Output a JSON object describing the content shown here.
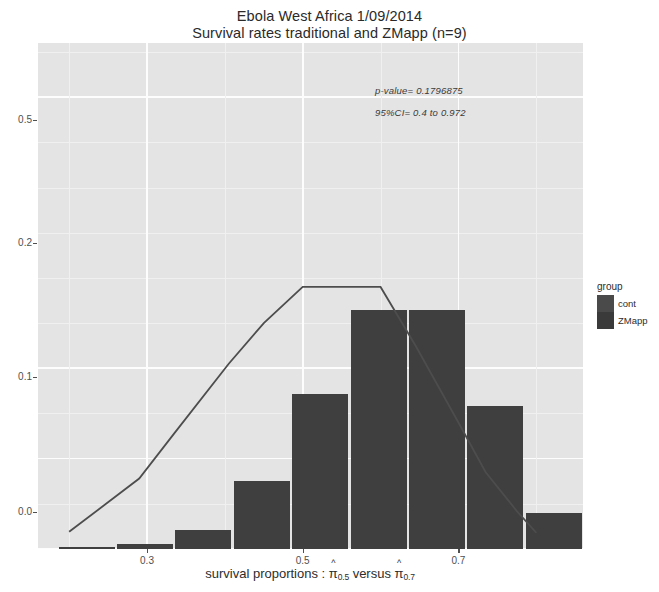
{
  "title": {
    "line1": "Ebola West Africa 1/09/2014",
    "line2": "Survival rates traditional and ZMapp (n=9)"
  },
  "annotations": {
    "p_value": "p-value=  0.1796875",
    "conf_int": "95%CI=  0.4 to 0.972"
  },
  "axis": {
    "x_title_prefix": "survival proportions : ",
    "x_title_var1": "π",
    "x_title_sub1": "0.5",
    "x_title_middle": " versus ",
    "x_title_var2": "π",
    "x_title_sub2": "0.7",
    "y_title": "Density"
  },
  "legend": {
    "title": "group",
    "items": [
      {
        "label": "cont",
        "color": "#4a4a4a"
      },
      {
        "label": "ZMapp",
        "color": "#3a3a3a"
      }
    ]
  },
  "colors": {
    "bar": "#3f3f3f",
    "line": "#4d4d4d",
    "panel": "#e4e4e4",
    "gridline": "#fdfdfd",
    "text": "#2d2d2d"
  },
  "chart_data": {
    "type": "bar",
    "xlabel": "survival proportions : pi-hat_0.5 versus pi-hat_0.7",
    "ylabel": "Density",
    "xlim": [
      0.16,
      0.86
    ],
    "ylim": [
      0.0,
      0.56
    ],
    "grid": true,
    "legend_position": "right",
    "x_ticks": [
      {
        "value": 0.3,
        "label": "0.3"
      },
      {
        "value": 0.5,
        "label": "0.5"
      },
      {
        "value": 0.7,
        "label": "0.7"
      }
    ],
    "y_ticks": [
      {
        "value": 0.5,
        "label": "0.5"
      },
      {
        "value": 0.2,
        "label": "0.2"
      },
      {
        "value": 0.1,
        "label": "0.1"
      },
      {
        "value": 0.0,
        "label": "0.0"
      }
    ],
    "bar_edges": [
      0.185,
      0.26,
      0.335,
      0.41,
      0.485,
      0.56,
      0.635,
      0.71,
      0.785,
      0.86
    ],
    "categories": [
      "0.185-0.26",
      "0.26-0.335",
      "0.335-0.41",
      "0.41-0.485",
      "0.485-0.56",
      "0.56-0.635",
      "0.635-0.71",
      "0.71-0.785",
      "0.785-0.86"
    ],
    "values": [
      0.002,
      0.006,
      0.021,
      0.075,
      0.172,
      0.265,
      0.265,
      0.158,
      0.04
    ],
    "series": [
      {
        "name": "Density histogram",
        "type": "bar",
        "values": [
          0.002,
          0.006,
          0.021,
          0.075,
          0.172,
          0.265,
          0.265,
          0.158,
          0.04
        ]
      },
      {
        "name": "Overlay curve",
        "type": "line",
        "x": [
          0.2,
          0.255,
          0.29,
          0.335,
          0.405,
          0.45,
          0.5,
          0.555,
          0.6,
          0.645,
          0.7,
          0.735,
          0.775,
          0.8
        ],
        "y": [
          0.019,
          0.055,
          0.078,
          0.128,
          0.205,
          0.25,
          0.29,
          0.29,
          0.29,
          0.225,
          0.14,
          0.085,
          0.042,
          0.018
        ]
      }
    ],
    "annotations": [
      {
        "text": "p-value=  0.1796875",
        "x": 0.66,
        "y": 0.455
      },
      {
        "text": "95%CI=  0.4 to 0.972",
        "x": 0.66,
        "y": 0.415
      }
    ]
  }
}
